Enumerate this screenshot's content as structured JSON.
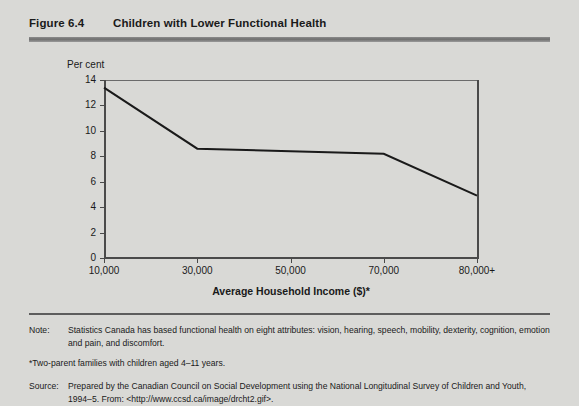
{
  "figure": {
    "number": "Figure 6.4",
    "title": "Children with Lower Functional Health"
  },
  "chart_data": {
    "type": "line",
    "title": "Children with Lower Functional Health",
    "xlabel": "Average Household Income ($)*",
    "ylabel": "Per cent",
    "categories": [
      "10,000",
      "30,000",
      "50,000",
      "70,000",
      "80,000+"
    ],
    "x": [
      10000,
      30000,
      50000,
      70000,
      80000
    ],
    "values": [
      13.4,
      8.6,
      8.4,
      8.2,
      4.9
    ],
    "series": [
      {
        "name": "Children with lower functional health",
        "values": [
          13.4,
          8.6,
          8.4,
          8.2,
          4.9
        ]
      }
    ],
    "xlim": [
      10000,
      80000
    ],
    "ylim": [
      0,
      14
    ],
    "ytick_labels": [
      "0",
      "2",
      "4",
      "6",
      "8",
      "10",
      "12",
      "14"
    ],
    "ytick_values": [
      0,
      2,
      4,
      6,
      8,
      10,
      12,
      14
    ],
    "xtick_labels": [
      "10,000",
      "30,000",
      "50,000",
      "70,000",
      "80,000+"
    ],
    "grid": false,
    "legend": "none",
    "line_color": "#1a1a1a"
  },
  "notes": {
    "note_label": "Note:",
    "note_text": "Statistics Canada has based functional health on eight attributes: vision, hearing, speech, mobility, dexterity, cognition, emotion and pain, and discomfort.",
    "footnote": "*Two-parent families with children aged 4–11 years.",
    "source_label": "Source:",
    "source_text": "Prepared by the Canadian Council on Social Development using the National Longitudinal Survey of Children and Youth, 1994–5. From: <http://www.ccsd.ca/image/drcht2.gif>."
  },
  "colors": {
    "background": "#d9d9d6",
    "rule": "#6f6f6f",
    "axis": "#4a4a4a",
    "line": "#1a1a1a"
  }
}
